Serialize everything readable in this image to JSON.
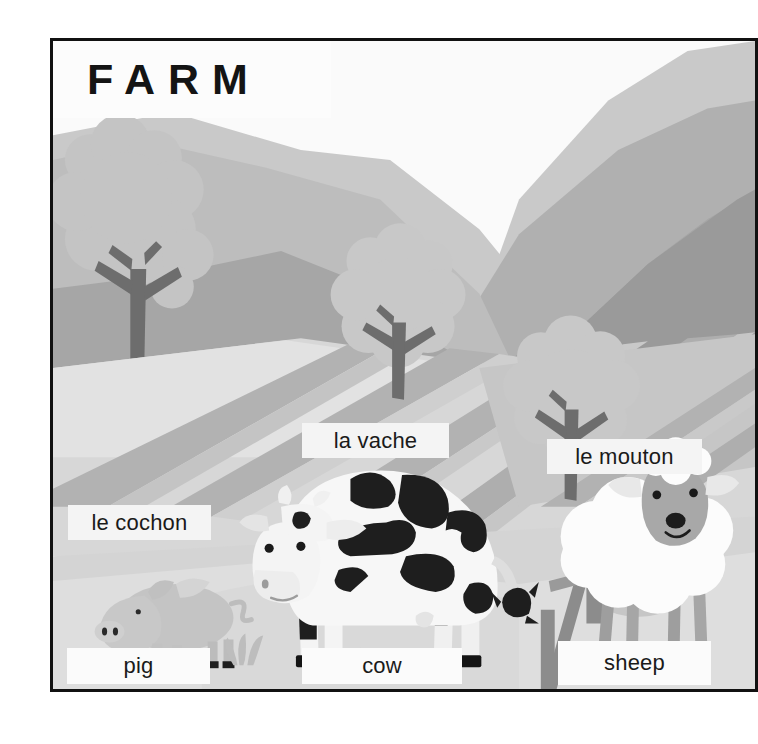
{
  "poster": {
    "title": "FARM",
    "background_color": "#f2f2f2",
    "frame_color": "#111111",
    "label_box_color": "#f4f4f4",
    "label_text_color": "#1a1a1a"
  },
  "palette": {
    "sky": "#fafafa",
    "mountain_far": "#c9c9c9",
    "mountain_mid": "#b5b5b5",
    "mountain_near": "#a3a3a3",
    "mountain_dark": "#999999",
    "field_light": "#dcdcdc",
    "field_mid": "#c2c2c2",
    "field_stripe": "#aeaeae",
    "foreground": "#d2d2d2",
    "tree_trunk": "#6f6f6f",
    "tree_foliage": "#c6c6c6",
    "fence": "#8a8a8a",
    "cow_body": "#f7f7f7",
    "cow_spot": "#1e1e1e",
    "pig_body": "#c6c6c6",
    "sheep_wool": "#fbfbfb",
    "sheep_head": "#a8a8a8",
    "hoof": "#1a1a1a"
  },
  "labels": [
    {
      "id": "pig-fr",
      "text": "le cochon",
      "language": "fr",
      "animal": "pig"
    },
    {
      "id": "cow-fr",
      "text": "la vache",
      "language": "fr",
      "animal": "cow"
    },
    {
      "id": "sheep-fr",
      "text": "le mouton",
      "language": "fr",
      "animal": "sheep"
    },
    {
      "id": "pig-en",
      "text": "pig",
      "language": "en",
      "animal": "pig"
    },
    {
      "id": "cow-en",
      "text": "cow",
      "language": "en",
      "animal": "cow"
    },
    {
      "id": "sheep-en",
      "text": "sheep",
      "language": "en",
      "animal": "sheep"
    }
  ],
  "scene": {
    "animals": [
      "cow",
      "pig",
      "sheep"
    ],
    "props": [
      "fence",
      "tree-left",
      "tree-center",
      "tree-right",
      "grass-tuft"
    ],
    "description": "Flat illustrated farm landscape with layered grey mountains, striped fields, three trees, a wooden fence and three farm animals"
  }
}
